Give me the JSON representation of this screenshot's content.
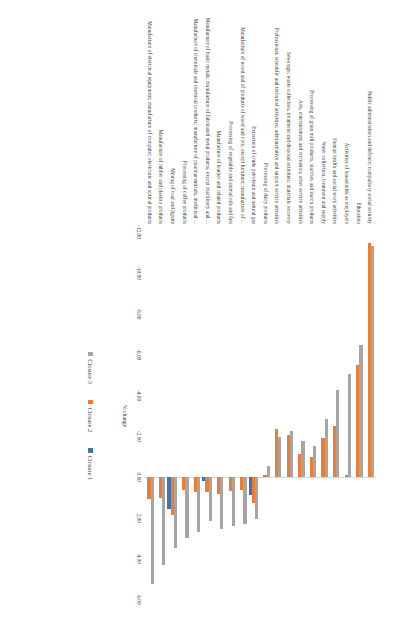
{
  "chart_data": {
    "type": "bar",
    "title": "",
    "xlabel": "% change",
    "ylabel": "",
    "orientation": "horizontal",
    "xlim": [
      -12.0,
      6.0
    ],
    "xticks": [
      "-12.00",
      "-10.00",
      "-8.00",
      "-6.00",
      "-4.00",
      "-2.00",
      "0.00",
      "2.00",
      "4.00",
      "6.00"
    ],
    "xtick_values": [
      -12,
      -10,
      -8,
      -6,
      -4,
      -2,
      0,
      2,
      4,
      6
    ],
    "grid": false,
    "legend_position": "bottom",
    "categories": [
      "Public administration and defence; compulsory social security",
      "Education",
      "Activities of households as employers",
      "Human health and social work activities",
      "Water collection, treatment and supply",
      "Processing of grain mill products, starches and starch products",
      "Arts, entertainment and recreation; other service activities",
      "Sewerage; waste collection, treatment and disposal activities; materials recovery",
      "Professional, scientific and technical activities; administrative and support service activities",
      "Processing of dairy products",
      "Extraction of crude petroleum and natural gas",
      "Manufacture of wood and of products of wood and cork, except furniture; manufacture of ...",
      "Processing of vegetable and animal oils and fats",
      "Manufacture of leather and related products",
      "Manufacture of basic metals; manufacture of fabricated metal products, except machinery and ...",
      "Manufacture of chemicals and chemical products; manufacture of pharmaceuticals, medicinal ...",
      "Processing of coffee products",
      "Mining of coal and lignite",
      "Manufacture of rubber and plastics products",
      "Manufacture of electrical equipment; manufacture of computer, electronic and optical products"
    ],
    "series": [
      {
        "name": "Closure 3",
        "color": "#a5a5a5",
        "values": [
          -11.3,
          -6.45,
          -5.05,
          -4.25,
          -2.85,
          -1.55,
          -1.8,
          -2.25,
          -1.95,
          -0.55,
          2.05,
          2.3,
          2.4,
          2.55,
          2.15,
          2.65,
          2.95,
          3.45,
          4.3,
          5.2
        ]
      },
      {
        "name": "Closure 2",
        "color": "#ed7d31",
        "values": [
          -11.45,
          -5.5,
          -0.1,
          -2.5,
          -1.9,
          -1.0,
          -1.15,
          -2.05,
          -2.35,
          -0.1,
          1.25,
          0.6,
          0.65,
          0.8,
          0.7,
          0.7,
          0.6,
          1.85,
          1.0,
          1.05
        ]
      },
      {
        "name": "Closure 1",
        "color": "#4472a8",
        "values": [
          0.0,
          0.0,
          0.0,
          0.0,
          0.0,
          0.0,
          0.0,
          0.0,
          0.0,
          0.0,
          0.85,
          0.0,
          0.0,
          0.0,
          0.2,
          0.0,
          0.0,
          1.55,
          0.0,
          0.0
        ]
      }
    ],
    "legend": [
      "Closure 3",
      "Closure 2",
      "Closure 1"
    ]
  }
}
